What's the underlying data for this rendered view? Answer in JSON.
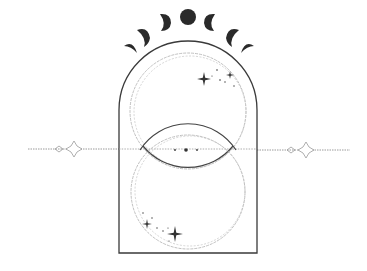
{
  "illustration": {
    "title": "Celestial arch with moon phases and interlocking circles",
    "colors": {
      "background": "#ffffff",
      "ink": "#2b2b2b",
      "moon": "#2a2a2a",
      "faint": "#8a8a8a"
    },
    "moon_phases": [
      "waxing-crescent-thin",
      "waxing-crescent",
      "waxing-crescent-thick",
      "full-moon",
      "waning-crescent-thick",
      "waning-crescent",
      "waning-crescent-thin"
    ],
    "elements": [
      "moon-phase-row",
      "arch-frame",
      "upper-circle",
      "lower-circle",
      "horizon-line",
      "sparkle-stars"
    ]
  }
}
